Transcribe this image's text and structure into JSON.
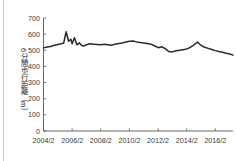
{
  "figure": {
    "title": "",
    "axis_color": "#555555",
    "line_color": "#2b2b2b",
    "edge_rule_color": "#b9cddd"
  },
  "axes": {
    "y_label": "6分間歩行距離（m）",
    "y_ticks": [
      "0",
      "100",
      "200",
      "300",
      "400",
      "500",
      "600",
      "700"
    ],
    "x_ticks": [
      "2004/2",
      "2006/2",
      "2008/2",
      "2010/2",
      "2012/2",
      "2014/2",
      "2016/2"
    ]
  },
  "chart_data": {
    "type": "line",
    "title": "",
    "xlabel": "",
    "ylabel": "6分間歩行距離（m）",
    "ylim": [
      0,
      700
    ],
    "yticks": [
      0,
      100,
      200,
      300,
      400,
      500,
      600,
      700
    ],
    "xtick_labels": [
      "2004/2",
      "2006/2",
      "2008/2",
      "2010/2",
      "2012/2",
      "2014/2",
      "2016/2"
    ],
    "xtick_values": [
      2004.17,
      2006.17,
      2008.17,
      2010.17,
      2012.17,
      2014.17,
      2016.17
    ],
    "xlim": [
      2004.17,
      2017.4
    ],
    "grid": false,
    "legend": null,
    "series": [
      {
        "name": "6分間歩行距離",
        "x": [
          2004.17,
          2004.42,
          2004.67,
          2004.92,
          2005.17,
          2005.42,
          2005.58,
          2005.75,
          2005.92,
          2006.08,
          2006.17,
          2006.33,
          2006.5,
          2006.67,
          2006.83,
          2007.0,
          2007.17,
          2007.42,
          2007.67,
          2007.92,
          2008.17,
          2008.42,
          2008.67,
          2008.92,
          2009.17,
          2009.42,
          2009.67,
          2009.92,
          2010.17,
          2010.42,
          2010.67,
          2010.92,
          2011.17,
          2011.42,
          2011.67,
          2011.92,
          2012.17,
          2012.42,
          2012.67,
          2012.92,
          2013.17,
          2013.42,
          2013.67,
          2013.92,
          2014.17,
          2014.42,
          2014.67,
          2014.92,
          2015.17,
          2015.42,
          2015.67,
          2015.92,
          2016.17,
          2016.42,
          2016.67,
          2016.92,
          2017.17,
          2017.4
        ],
        "y": [
          515,
          520,
          524,
          531,
          536,
          540,
          545,
          615,
          556,
          568,
          540,
          578,
          534,
          546,
          530,
          527,
          534,
          540,
          538,
          536,
          534,
          537,
          535,
          531,
          538,
          542,
          545,
          551,
          556,
          558,
          552,
          548,
          545,
          542,
          538,
          528,
          516,
          522,
          510,
          492,
          490,
          497,
          500,
          504,
          508,
          518,
          534,
          551,
          530,
          519,
          512,
          505,
          498,
          492,
          488,
          482,
          477,
          470
        ]
      }
    ]
  }
}
